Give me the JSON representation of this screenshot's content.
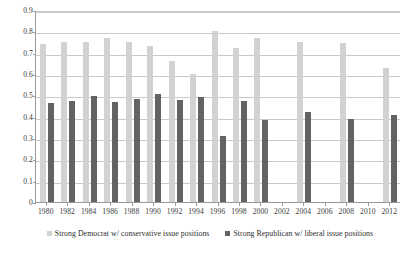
{
  "chart_data": {
    "type": "bar",
    "title": "",
    "subtitle": "",
    "xlabel": "",
    "ylabel": "",
    "ylim": [
      0,
      0.9
    ],
    "xlim_categories": [
      "1980",
      "1982",
      "1984",
      "1986",
      "1988",
      "1990",
      "1992",
      "1994",
      "1996",
      "1998",
      "2000",
      "2002",
      "2004",
      "2006",
      "2008",
      "2010",
      "2012"
    ],
    "grid": true,
    "legend_position": "bottom-center",
    "ytick_labels": [
      "0.9",
      "0.8",
      "0.7",
      "0.6",
      "0.5",
      "0.4",
      "0.3",
      "0.2",
      "0.1",
      "0"
    ],
    "ytick_values": [
      0.9,
      0.8,
      0.7,
      0.6,
      0.5,
      0.4,
      0.3,
      0.2,
      0.1,
      0
    ],
    "categories": [
      "1980",
      "1982",
      "1984",
      "1986",
      "1988",
      "1990",
      "1992",
      "1994",
      "1996",
      "1998",
      "2000",
      "2002",
      "2004",
      "2006",
      "2008",
      "2010",
      "2012"
    ],
    "series": [
      {
        "name": "Strong Democrat w/ conservative issue positions",
        "color": "#d2d2d2",
        "values": [
          0.74,
          0.75,
          0.75,
          0.77,
          0.75,
          0.73,
          0.66,
          0.6,
          0.8,
          0.72,
          0.77,
          null,
          0.75,
          null,
          0.745,
          null,
          0.63
        ]
      },
      {
        "name": "Strong Republican w/ liberal issue positions",
        "color": "#636363",
        "values": [
          0.465,
          0.475,
          0.495,
          0.47,
          0.485,
          0.505,
          0.48,
          0.49,
          0.31,
          0.475,
          0.385,
          null,
          0.42,
          null,
          0.39,
          null,
          0.41
        ]
      }
    ]
  },
  "legend": {
    "entries": [
      {
        "label": "Strong Democrat w/ conservative issue positions",
        "swatch": "light"
      },
      {
        "label": "Strong Republican w/ liberal issue positions",
        "swatch": "dark"
      }
    ]
  }
}
